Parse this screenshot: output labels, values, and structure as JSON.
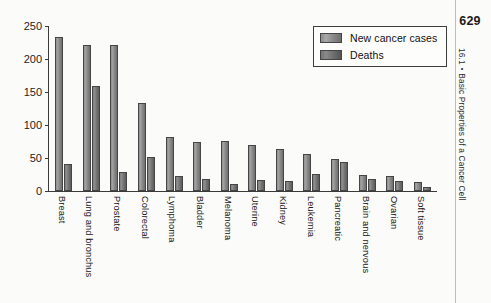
{
  "page": {
    "number": "629",
    "running_head_section": "16.1",
    "running_head_separator": "•",
    "running_head_title": "Basic Properties of a Cancer Cell"
  },
  "legend": {
    "position": "top-right",
    "items": [
      {
        "label": "New cancer cases",
        "key": "cases",
        "color": "#8d8d8d"
      },
      {
        "label": "Deaths",
        "key": "deaths",
        "color": "#6f6f6f"
      }
    ]
  },
  "chart_data": {
    "type": "bar",
    "title": "",
    "xlabel": "",
    "ylabel": "",
    "ylim": [
      0,
      250
    ],
    "yticks": [
      0,
      50,
      100,
      150,
      200,
      250
    ],
    "ytick_labels": [
      "0",
      "50",
      "100",
      "150",
      "200",
      "250"
    ],
    "grid": false,
    "legend_position": "top-right",
    "units": "thousands of people per year",
    "categories": [
      "Breast",
      "Lung and bronchus",
      "Prostate",
      "Colorectal",
      "Lymphoma",
      "Bladder",
      "Melanoma",
      "Uterine",
      "Kidney",
      "Leukemia",
      "Pancreatic",
      "Brain and nervous",
      "Ovarian",
      "Soft tissue"
    ],
    "series": [
      {
        "name": "New cancer cases",
        "values": [
          233,
          221,
          221,
          134,
          82,
          75,
          76,
          70,
          64,
          56,
          48,
          24,
          23,
          13
        ]
      },
      {
        "name": "Deaths",
        "values": [
          41,
          159,
          29,
          52,
          22,
          18,
          11,
          17,
          15,
          26,
          44,
          18,
          15,
          6
        ]
      }
    ]
  }
}
